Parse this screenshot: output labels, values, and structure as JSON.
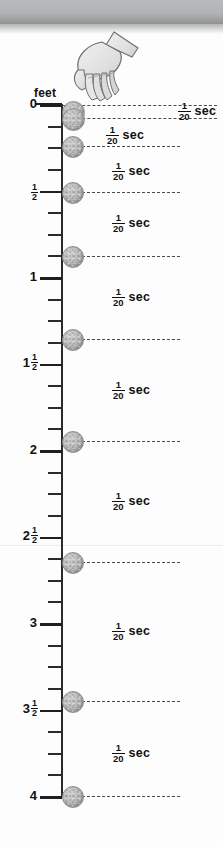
{
  "figure": {
    "name": "strobe-photo-falling-ball-diagram",
    "type": "physics-illustration",
    "axis": {
      "unit_label": "feet",
      "orientation": "vertical",
      "direction": "downward",
      "range_ft": [
        0,
        4
      ],
      "minor_tick_step_ft": 0.125,
      "major_labels": [
        {
          "text": "0",
          "int": "0",
          "num": "",
          "den": "",
          "feet": 0.0,
          "y": 104
        },
        {
          "text": "1/2",
          "int": "",
          "num": "1",
          "den": "2",
          "feet": 0.5,
          "y": 190
        },
        {
          "text": "1",
          "int": "1",
          "num": "",
          "den": "",
          "feet": 1.0,
          "y": 277
        },
        {
          "text": "1 1/2",
          "int": "1",
          "num": "1",
          "den": "2",
          "feet": 1.5,
          "y": 364
        },
        {
          "text": "2",
          "int": "2",
          "num": "",
          "den": "",
          "feet": 2.0,
          "y": 450
        },
        {
          "text": "2 1/2",
          "int": "2",
          "num": "1",
          "den": "2",
          "feet": 2.5,
          "y": 537
        },
        {
          "text": "3",
          "int": "3",
          "num": "",
          "den": "",
          "feet": 3.0,
          "y": 623
        },
        {
          "text": "3 1/2",
          "int": "3",
          "num": "1",
          "den": "2",
          "feet": 3.5,
          "y": 710
        },
        {
          "text": "4",
          "int": "4",
          "num": "",
          "den": "",
          "feet": 4.0,
          "y": 796
        }
      ]
    },
    "interval_label": {
      "num": "1",
      "den": "20",
      "unit": "sec",
      "full_text": "1/20 sec"
    },
    "balls": [
      {
        "index": 0,
        "feet": 0.0,
        "y": 111,
        "d": 21,
        "dash_y": 105,
        "dash_x": 62,
        "dash_w": 155
      },
      {
        "index": 1,
        "feet": 0.04,
        "y": 118,
        "d": 21,
        "dash_y": 118,
        "dash_x": 62,
        "dash_w": 155
      },
      {
        "index": 2,
        "feet": 0.19,
        "y": 146,
        "d": 20,
        "dash_y": 146,
        "dash_x": 62,
        "dash_w": 118
      },
      {
        "index": 3,
        "feet": 0.46,
        "y": 192,
        "d": 20,
        "dash_y": 192,
        "dash_x": 62,
        "dash_w": 118
      },
      {
        "index": 4,
        "feet": 0.83,
        "y": 256,
        "d": 20,
        "dash_y": 256,
        "dash_x": 62,
        "dash_w": 118
      },
      {
        "index": 5,
        "feet": 1.31,
        "y": 339,
        "d": 20,
        "dash_y": 339,
        "dash_x": 62,
        "dash_w": 118
      },
      {
        "index": 6,
        "feet": 1.9,
        "y": 441,
        "d": 20,
        "dash_y": 441,
        "dash_x": 62,
        "dash_w": 118
      },
      {
        "index": 7,
        "feet": 2.6,
        "y": 562,
        "d": 20,
        "dash_y": 562,
        "dash_x": 62,
        "dash_w": 118
      },
      {
        "index": 8,
        "feet": 3.4,
        "y": 701,
        "d": 20,
        "dash_y": 701,
        "dash_x": 62,
        "dash_w": 118
      },
      {
        "index": 9,
        "feet": 4.0,
        "y": 796,
        "d": 20,
        "dash_y": 796,
        "dash_x": 62,
        "dash_w": 118
      }
    ],
    "intervals": [
      {
        "index": 0,
        "x": 178,
        "y": 110,
        "align": "right-edge"
      },
      {
        "index": 1,
        "x": 106,
        "y": 134,
        "align": "inline"
      },
      {
        "index": 2,
        "x": 112,
        "y": 170,
        "align": "inline"
      },
      {
        "index": 3,
        "x": 112,
        "y": 222,
        "align": "inline"
      },
      {
        "index": 4,
        "x": 112,
        "y": 296,
        "align": "inline"
      },
      {
        "index": 5,
        "x": 112,
        "y": 389,
        "align": "inline"
      },
      {
        "index": 6,
        "x": 112,
        "y": 500,
        "align": "inline"
      },
      {
        "index": 7,
        "x": 112,
        "y": 630,
        "align": "inline"
      },
      {
        "index": 8,
        "x": 112,
        "y": 752,
        "align": "inline"
      }
    ],
    "hand": {
      "name": "hand-releasing-ball",
      "x": 58,
      "y": 26,
      "w": 86,
      "h": 86
    },
    "colors": {
      "ink": "#111111",
      "rule": "#2b2b2b",
      "dash": "#4b4b4b",
      "ball_fill": "#b8b8b8",
      "ball_edge": "#8d8d8d",
      "top_band": "#b0b2b4",
      "page": "#fdfdfd"
    },
    "ghost_text": [
      {
        "text": "",
        "x": 40,
        "y": 44
      },
      {
        "text": "",
        "x": 30,
        "y": 210
      },
      {
        "text": "",
        "x": 30,
        "y": 252
      },
      {
        "text": "",
        "x": 18,
        "y": 320
      }
    ]
  }
}
